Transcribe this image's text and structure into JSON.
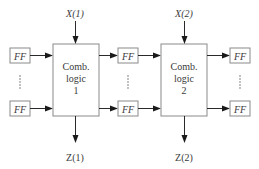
{
  "diagram": {
    "type": "iterative sequential circuit (cascaded combinational logic with flip-flop stages)",
    "inputs": [
      {
        "label": "X(1)",
        "x": 75
      },
      {
        "label": "X(2)",
        "x": 184
      }
    ],
    "outputs": [
      {
        "label": "Z(1)",
        "x": 75
      },
      {
        "label": "Z(2)",
        "x": 184
      }
    ],
    "blocks": [
      {
        "title_line1": "Comb.",
        "title_line2": "logic",
        "index": "1"
      },
      {
        "title_line1": "Comb.",
        "title_line2": "logic",
        "index": "2"
      }
    ],
    "flip_flop_label": "FF",
    "flip_flop_columns": [
      {
        "name": "left",
        "count_visible": 2
      },
      {
        "name": "middle",
        "count_visible": 2
      },
      {
        "name": "right",
        "count_visible": 2
      }
    ],
    "colors": {
      "box_stroke": "#8a8a8a",
      "wire": "#2a2a2a",
      "text": "#3a3a3a",
      "background": "#ffffff"
    }
  }
}
